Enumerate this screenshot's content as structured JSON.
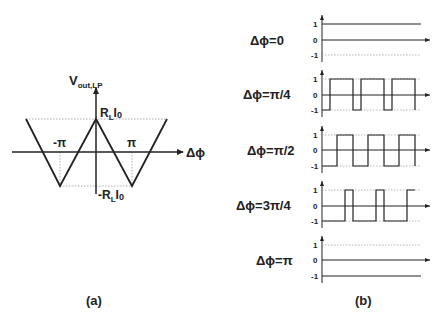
{
  "panel_a": {
    "caption": "(a)",
    "y_axis_label": "V",
    "y_axis_sub": "out,LP",
    "x_axis_label": "Δϕ",
    "top_label_main": "R",
    "top_label_sub": "L",
    "top_label_tail": "I",
    "top_label_tail_sub": "0",
    "bottom_label_main": "-R",
    "bottom_label_sub": "L",
    "bottom_label_tail": "I",
    "bottom_label_tail_sub": "0",
    "neg_pi_label": "-π",
    "pi_label": "π",
    "description": "Triangular transfer curve: peak R_L I_0 at Δϕ=0, troughs -R_L I_0 at ±π"
  },
  "panel_b": {
    "caption": "(b)",
    "tick_labels": [
      "1",
      "0",
      "-1"
    ],
    "plots": [
      {
        "label": "Δϕ=0",
        "waveform": "constant +1"
      },
      {
        "label": "Δϕ=π/4",
        "waveform": "square, duty 75% high"
      },
      {
        "label": "Δϕ=π/2",
        "waveform": "square, duty 50% high"
      },
      {
        "label": "Δϕ=3π/4",
        "waveform": "square, duty 25% high"
      },
      {
        "label": "Δϕ=π",
        "waveform": "constant -1"
      }
    ]
  },
  "colors": {
    "line": "#222222",
    "guide": "#999999"
  }
}
